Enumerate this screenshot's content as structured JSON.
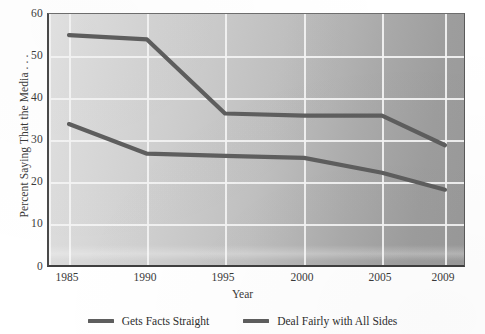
{
  "chart_data": {
    "type": "line",
    "title": "",
    "xlabel": "Year",
    "ylabel": "Percent Saying That the Media . . .",
    "x": [
      1985,
      1990,
      1995,
      2000,
      2005,
      2009
    ],
    "categories": [
      "1985",
      "1990",
      "1995",
      "2000",
      "2005",
      "2009"
    ],
    "series": [
      {
        "name": "Deal Fairly with All Sides",
        "values": [
          55,
          54,
          36.5,
          36,
          36,
          29
        ],
        "color": "#5e5e5e"
      },
      {
        "name": "Gets Facts Straight",
        "values": [
          34,
          27,
          26.5,
          26,
          22.5,
          18.5
        ],
        "color": "#5e5e5e"
      }
    ],
    "ylim": [
      0,
      60
    ],
    "yticks": [
      0,
      10,
      20,
      30,
      40,
      50,
      60
    ],
    "ytick_labels": [
      "0",
      "10",
      "20",
      "30",
      "40",
      "50",
      "60"
    ],
    "xlim": [
      1985,
      2009
    ],
    "grid": true,
    "legend_position": "bottom",
    "legend_entries": [
      "Gets Facts Straight",
      "Deal Fairly with All Sides"
    ]
  },
  "axes": {
    "y_title": "Percent Saying That the Media . . .",
    "x_title": "Year",
    "y_labels": [
      "60",
      "50",
      "40",
      "30",
      "20",
      "10",
      "0"
    ],
    "x_labels": [
      "1985",
      "1990",
      "1995",
      "2000",
      "2005",
      "2009"
    ]
  },
  "legend": {
    "items": [
      {
        "label": "Gets Facts Straight",
        "swatch": "line-swatch-icon"
      },
      {
        "label": "Deal Fairly with All Sides",
        "swatch": "line-swatch-icon"
      }
    ]
  },
  "colors": {
    "line": "#5e5e5e",
    "grid": "#f4f4f4",
    "panel_light": "#e2e2e2",
    "panel_dark": "#999999",
    "text": "#2e2e2e"
  }
}
